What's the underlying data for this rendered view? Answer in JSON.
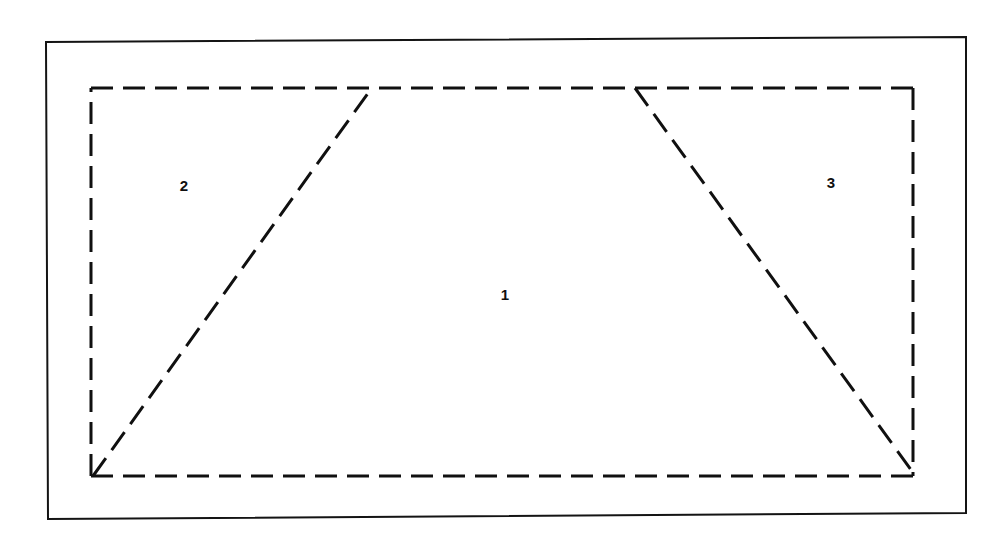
{
  "figure": {
    "canvas": {
      "width": 1004,
      "height": 539
    },
    "background_color": "#ffffff",
    "ink_color": "#101010"
  },
  "outer_frame": {
    "name": "outer-solid-rectangle",
    "stroke_color": "#141414",
    "stroke_width": 2,
    "stroke_style": "solid",
    "points": "46,42 966,37 966,513 48,519"
  },
  "dashed_boundary": {
    "name": "dashed-rectangle",
    "stroke_color": "#101010",
    "stroke_width": 3,
    "stroke_style": "dashed",
    "dash_pattern": "22 10",
    "left": 91,
    "top": 88,
    "right": 913,
    "bottom": 476
  },
  "dividers": [
    {
      "name": "left-diagonal",
      "from": {
        "x": 93,
        "y": 476
      },
      "to": {
        "x": 371,
        "y": 89
      },
      "stroke_style": "dashed",
      "dash_pattern": "22 10"
    },
    {
      "name": "right-diagonal",
      "from": {
        "x": 635,
        "y": 88
      },
      "to": {
        "x": 914,
        "y": 474
      },
      "stroke_style": "dashed",
      "dash_pattern": "22 10"
    }
  ],
  "regions": [
    {
      "id": "region-1",
      "label": "1",
      "shape": "trapezoid",
      "position": {
        "x": 505,
        "y": 296
      }
    },
    {
      "id": "region-2",
      "label": "2",
      "shape": "triangle",
      "position": {
        "x": 184,
        "y": 187
      }
    },
    {
      "id": "region-3",
      "label": "3",
      "shape": "triangle",
      "position": {
        "x": 831,
        "y": 184
      }
    }
  ]
}
